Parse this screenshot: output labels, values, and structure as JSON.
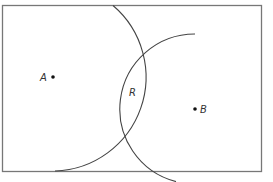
{
  "diagram": {
    "colors": {
      "border": "#777777",
      "arc": "#444444",
      "point": "#111111",
      "label": "#333333"
    },
    "rectangle": {
      "x": 2.5,
      "y": 5.5,
      "width": 259,
      "height": 166
    },
    "points": [
      {
        "id": "A",
        "label": "A",
        "x": 53,
        "y": 77
      },
      {
        "id": "B",
        "label": "B",
        "x": 195,
        "y": 109
      }
    ],
    "arcs": [
      {
        "id": "circle-A",
        "center": "A",
        "radius": 94
      },
      {
        "id": "circle-B",
        "center": "B",
        "radius": 75
      }
    ],
    "region_label": {
      "label": "R",
      "x": 133,
      "y": 95
    }
  }
}
